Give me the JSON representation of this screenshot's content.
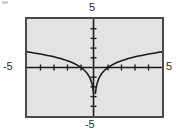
{
  "figure": {
    "background_color": "#ffffff",
    "plot_background_color": "#e3e3e3",
    "frame_color": "#4a4a4a",
    "axis_color": "#1a1a1a",
    "curve_color": "#1a1a1a"
  },
  "labels": {
    "top": "5",
    "left": "-5",
    "right": "5",
    "bottom": "-5"
  },
  "chart_data": {
    "type": "line",
    "title": "",
    "xlabel": "",
    "ylabel": "",
    "xlim": [
      -5,
      5
    ],
    "ylim": [
      -5,
      5
    ],
    "grid": false,
    "legend": null,
    "xticks": [
      -5,
      -4,
      -3,
      -2,
      -1,
      0,
      1,
      2,
      3,
      4,
      5
    ],
    "yticks": [
      -5,
      -4,
      -3,
      -2,
      -1,
      0,
      1,
      2,
      3,
      4,
      5
    ],
    "tick_labels_shown": [
      "-5",
      "5",
      "-5",
      "5"
    ],
    "axis_style": "centered-cross-with-ticks",
    "series": [
      {
        "name": "y = ln|x|",
        "x": [
          -5.0,
          -4.75,
          -4.5,
          -4.25,
          -4.0,
          -3.75,
          -3.5,
          -3.25,
          -3.0,
          -2.75,
          -2.5,
          -2.25,
          -2.0,
          -1.75,
          -1.5,
          -1.25,
          -1.0,
          -0.85,
          -0.7,
          -0.55,
          -0.4,
          -0.3,
          -0.22,
          -0.16,
          -0.12,
          -0.09,
          -0.07
        ],
        "y": [
          1.61,
          1.56,
          1.5,
          1.45,
          1.39,
          1.32,
          1.25,
          1.18,
          1.1,
          1.01,
          0.92,
          0.81,
          0.69,
          0.56,
          0.41,
          0.22,
          0.0,
          -0.16,
          -0.36,
          -0.6,
          -0.92,
          -1.2,
          -1.51,
          -1.83,
          -2.12,
          -2.41,
          -2.66
        ]
      },
      {
        "name": "y = ln|x| (positive branch)",
        "x": [
          0.07,
          0.09,
          0.12,
          0.16,
          0.22,
          0.3,
          0.4,
          0.55,
          0.7,
          0.85,
          1.0,
          1.25,
          1.5,
          1.75,
          2.0,
          2.25,
          2.5,
          2.75,
          3.0,
          3.25,
          3.5,
          3.75,
          4.0,
          4.25,
          4.5,
          4.75,
          5.0
        ],
        "y": [
          -2.66,
          -2.41,
          -2.12,
          -1.83,
          -1.51,
          -1.2,
          -0.92,
          -0.6,
          -0.36,
          -0.16,
          0.0,
          0.22,
          0.41,
          0.56,
          0.69,
          0.81,
          0.92,
          1.01,
          1.1,
          1.18,
          1.25,
          1.32,
          1.39,
          1.45,
          1.5,
          1.56,
          1.61
        ]
      }
    ]
  }
}
